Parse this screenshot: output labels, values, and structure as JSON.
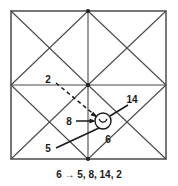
{
  "figure": {
    "name": "graph-grid-figure",
    "caption": "6 → 5, 8, 14, 2",
    "colors": {
      "stroke": "#4a4a4a",
      "outer_stroke": "#555555",
      "text": "#1a1a1a",
      "background": "#ffffff",
      "vertex_fill": "#222222"
    },
    "outer_square": {
      "label": "outer-square",
      "x": 11,
      "y": 11,
      "width": 155,
      "height": 148
    },
    "midlines": {
      "vertical_x": 88,
      "horizontal_y": 85
    },
    "highlight_circle": {
      "label": "circled-node",
      "cx": 103,
      "cy": 121,
      "r": 8,
      "glyph": "⌣"
    },
    "edge_labels": [
      {
        "id": "label-2",
        "text": "2",
        "x": 48,
        "y": 80,
        "anchor": "middle"
      },
      {
        "id": "label-14",
        "text": "14",
        "x": 130,
        "y": 102,
        "anchor": "middle"
      },
      {
        "id": "label-8",
        "text": "8",
        "x": 70,
        "y": 124,
        "anchor": "middle"
      },
      {
        "id": "label-6",
        "text": "6",
        "x": 108,
        "y": 142,
        "anchor": "middle"
      },
      {
        "id": "label-5",
        "text": "5",
        "x": 48,
        "y": 150,
        "anchor": "middle"
      }
    ],
    "caption_position": {
      "x": 89,
      "y": 178
    },
    "vertices": [
      {
        "id": "vertex-top-center",
        "x": 88,
        "y": 11
      },
      {
        "id": "vertex-center",
        "x": 88,
        "y": 85
      },
      {
        "id": "vertex-bottom-center",
        "x": 88,
        "y": 159
      }
    ]
  }
}
